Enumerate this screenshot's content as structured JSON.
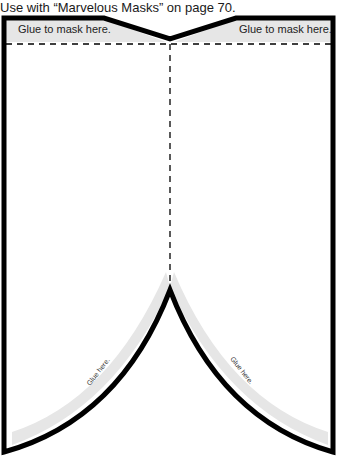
{
  "caption": "Use with “Marvelous Masks” on page 70.",
  "tabs": {
    "left": "Glue to mask here.",
    "right": "Glue to mask here."
  },
  "glue_strips": {
    "left": "Glue here.",
    "right": "Glue here."
  },
  "colors": {
    "outline": "#000000",
    "glue_area": "#e6e6e6",
    "fold_line": "#000000"
  }
}
